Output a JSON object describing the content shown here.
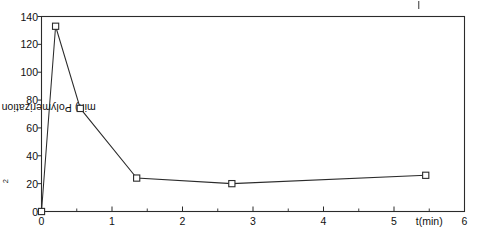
{
  "chart_data": {
    "type": "line",
    "title": "",
    "subtitle": "",
    "xlabel": "t(min)",
    "ylabel_prefix": "Polymerization rate (micro g/cm",
    "ylabel_sup": "2",
    "ylabel_suffix": " min)",
    "ylabel_plain": "Polymerization rate (micro g/cm2 min)",
    "xlim": [
      0,
      6
    ],
    "ylim": [
      0,
      140
    ],
    "xticks": [
      0,
      1,
      2,
      3,
      4,
      5,
      6
    ],
    "xtick_labels": [
      "0",
      "1",
      "2",
      "3",
      "4",
      "5",
      "6"
    ],
    "xminor_ticks": [
      0.5,
      1.5,
      2.5,
      3.5,
      4.5,
      5.5
    ],
    "yticks": [
      0,
      20,
      40,
      60,
      80,
      100,
      120,
      140
    ],
    "ytick_labels": [
      "0",
      "20",
      "40",
      "60",
      "80",
      "100",
      "120",
      "140"
    ],
    "grid": false,
    "legend": null,
    "marker": "open-square",
    "line_color": "#2b2b2b",
    "marker_fill": "#ffffff",
    "marker_edge": "#2b2b2b",
    "frame": true,
    "x": [
      0,
      0.2,
      0.55,
      1.35,
      2.7,
      5.45
    ],
    "values": [
      0,
      133,
      74,
      24,
      20,
      26
    ],
    "points": [
      {
        "x": 0,
        "y": 0
      },
      {
        "x": 0.2,
        "y": 133
      },
      {
        "x": 0.55,
        "y": 74
      },
      {
        "x": 1.35,
        "y": 24
      },
      {
        "x": 2.7,
        "y": 20
      },
      {
        "x": 5.45,
        "y": 26
      }
    ],
    "xlabel_position_x": 5.5,
    "annotations": [
      {
        "name": "stray-tick-mark",
        "x": 5.35,
        "note": "small vertical mark above plot frame"
      }
    ]
  }
}
